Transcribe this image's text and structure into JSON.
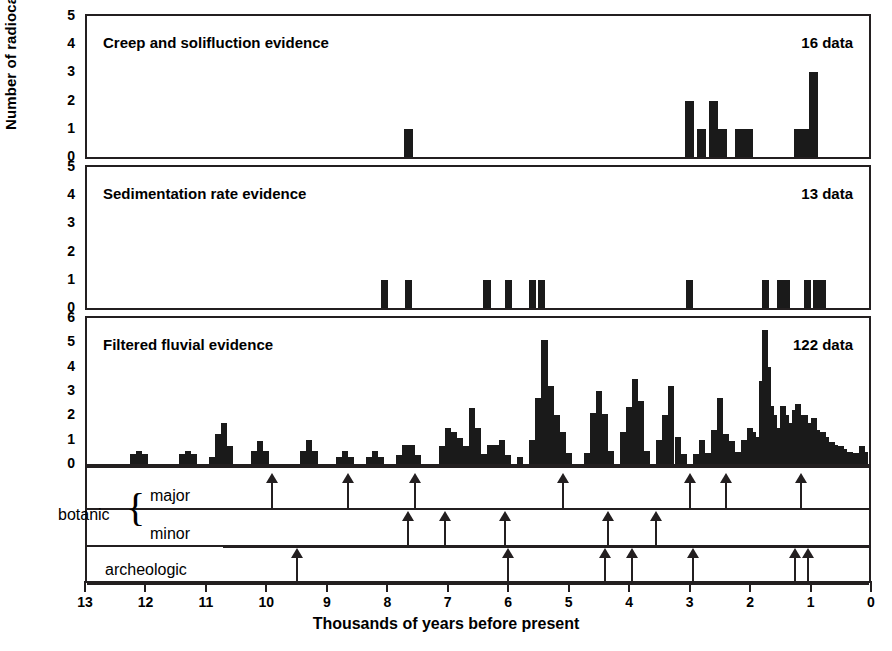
{
  "axis": {
    "ylabel": "Number of radiocarbon dates",
    "xlabel": "Thousands of years before present",
    "xticks": [
      "13",
      "12",
      "11",
      "10",
      "9",
      "8",
      "7",
      "6",
      "5",
      "4",
      "3",
      "2",
      "1",
      "0"
    ],
    "x_min_ka": 0,
    "x_max_ka": 13
  },
  "panels": [
    {
      "title": "Creep and solifluction evidence",
      "count_label": "16 data",
      "yticks": [
        "0",
        "1",
        "2",
        "3",
        "4",
        "5"
      ]
    },
    {
      "title": "Sedimentation rate evidence",
      "count_label": "13 data",
      "yticks": [
        "0",
        "1",
        "2",
        "3",
        "4",
        "5"
      ]
    },
    {
      "title": "Filtered fluvial evidence",
      "count_label": "122 data",
      "yticks": [
        "0",
        "1",
        "2",
        "3",
        "4",
        "5",
        "6"
      ]
    }
  ],
  "event_rows": [
    {
      "name": "botanic-major",
      "label": "major"
    },
    {
      "name": "botanic-minor",
      "label": "minor"
    },
    {
      "name": "archeologic",
      "label": "archeologic"
    }
  ],
  "group_label": "botanic",
  "chart_data": {
    "type": "bar",
    "xlabel": "Thousands of years before present",
    "ylabel": "Number of radiocarbon dates",
    "xlim": [
      13,
      0
    ],
    "x_axis_direction": "reversed",
    "grid": false,
    "legend": "none",
    "bin_width_ka": 0.1,
    "panels": [
      {
        "name": "creep-and-solifluction",
        "title": "Creep and solifluction evidence",
        "n_data": 16,
        "ylim": [
          0,
          5
        ],
        "yticks": [
          0,
          1,
          2,
          3,
          4,
          5
        ],
        "bars": [
          {
            "x_ka": 7.65,
            "value": 1,
            "width_ka": 0.15
          },
          {
            "x_ka": 3.0,
            "value": 2,
            "width_ka": 0.15
          },
          {
            "x_ka": 2.8,
            "value": 1,
            "width_ka": 0.15
          },
          {
            "x_ka": 2.6,
            "value": 2,
            "width_ka": 0.15
          },
          {
            "x_ka": 2.45,
            "value": 1,
            "width_ka": 0.15
          },
          {
            "x_ka": 2.1,
            "value": 1,
            "width_ka": 0.3
          },
          {
            "x_ka": 1.15,
            "value": 1,
            "width_ka": 0.25
          },
          {
            "x_ka": 0.95,
            "value": 3,
            "width_ka": 0.15
          }
        ]
      },
      {
        "name": "sedimentation-rate",
        "title": "Sedimentation rate evidence",
        "n_data": 13,
        "ylim": [
          0,
          5
        ],
        "yticks": [
          0,
          1,
          2,
          3,
          4,
          5
        ],
        "bars": [
          {
            "x_ka": 8.05,
            "value": 1,
            "width_ka": 0.12
          },
          {
            "x_ka": 7.65,
            "value": 1,
            "width_ka": 0.12
          },
          {
            "x_ka": 6.35,
            "value": 1,
            "width_ka": 0.12
          },
          {
            "x_ka": 6.0,
            "value": 1,
            "width_ka": 0.12
          },
          {
            "x_ka": 5.6,
            "value": 1,
            "width_ka": 0.12
          },
          {
            "x_ka": 5.45,
            "value": 1,
            "width_ka": 0.12
          },
          {
            "x_ka": 3.0,
            "value": 1,
            "width_ka": 0.12
          },
          {
            "x_ka": 1.75,
            "value": 1,
            "width_ka": 0.12
          },
          {
            "x_ka": 1.45,
            "value": 1,
            "width_ka": 0.22
          },
          {
            "x_ka": 1.05,
            "value": 1,
            "width_ka": 0.12
          },
          {
            "x_ka": 0.85,
            "value": 1,
            "width_ka": 0.22
          }
        ]
      },
      {
        "name": "filtered-fluvial",
        "title": "Filtered fluvial evidence",
        "n_data": 122,
        "ylim": [
          0,
          6
        ],
        "yticks": [
          0,
          1,
          2,
          3,
          4,
          5,
          6
        ],
        "bars": [
          {
            "x_ka": 12.2,
            "value": 0.4
          },
          {
            "x_ka": 12.1,
            "value": 0.55
          },
          {
            "x_ka": 12.0,
            "value": 0.4
          },
          {
            "x_ka": 11.4,
            "value": 0.4
          },
          {
            "x_ka": 11.3,
            "value": 0.55
          },
          {
            "x_ka": 11.2,
            "value": 0.4
          },
          {
            "x_ka": 10.9,
            "value": 0.3
          },
          {
            "x_ka": 10.8,
            "value": 1.25
          },
          {
            "x_ka": 10.7,
            "value": 1.7
          },
          {
            "x_ka": 10.6,
            "value": 0.75
          },
          {
            "x_ka": 10.2,
            "value": 0.55
          },
          {
            "x_ka": 10.1,
            "value": 0.95
          },
          {
            "x_ka": 10.0,
            "value": 0.55
          },
          {
            "x_ka": 9.4,
            "value": 0.55
          },
          {
            "x_ka": 9.3,
            "value": 1.0
          },
          {
            "x_ka": 9.2,
            "value": 0.55
          },
          {
            "x_ka": 8.8,
            "value": 0.3
          },
          {
            "x_ka": 8.7,
            "value": 0.55
          },
          {
            "x_ka": 8.6,
            "value": 0.3
          },
          {
            "x_ka": 8.3,
            "value": 0.3
          },
          {
            "x_ka": 8.2,
            "value": 0.55
          },
          {
            "x_ka": 8.1,
            "value": 0.3
          },
          {
            "x_ka": 7.8,
            "value": 0.35
          },
          {
            "x_ka": 7.7,
            "value": 0.8
          },
          {
            "x_ka": 7.6,
            "value": 0.8
          },
          {
            "x_ka": 7.5,
            "value": 0.35
          },
          {
            "x_ka": 7.1,
            "value": 0.75
          },
          {
            "x_ka": 7.0,
            "value": 1.5
          },
          {
            "x_ka": 6.9,
            "value": 1.3
          },
          {
            "x_ka": 6.8,
            "value": 1.05
          },
          {
            "x_ka": 6.7,
            "value": 0.75
          },
          {
            "x_ka": 6.6,
            "value": 2.3
          },
          {
            "x_ka": 6.5,
            "value": 1.5
          },
          {
            "x_ka": 6.4,
            "value": 0.4
          },
          {
            "x_ka": 6.3,
            "value": 0.8
          },
          {
            "x_ka": 6.2,
            "value": 0.8
          },
          {
            "x_ka": 6.1,
            "value": 1.0
          },
          {
            "x_ka": 6.0,
            "value": 0.35
          },
          {
            "x_ka": 5.8,
            "value": 0.3
          },
          {
            "x_ka": 5.6,
            "value": 1.0
          },
          {
            "x_ka": 5.5,
            "value": 2.7
          },
          {
            "x_ka": 5.4,
            "value": 5.1
          },
          {
            "x_ka": 5.3,
            "value": 3.2
          },
          {
            "x_ka": 5.2,
            "value": 2.0
          },
          {
            "x_ka": 5.1,
            "value": 1.3
          },
          {
            "x_ka": 5.0,
            "value": 0.45
          },
          {
            "x_ka": 4.7,
            "value": 0.45
          },
          {
            "x_ka": 4.6,
            "value": 2.1
          },
          {
            "x_ka": 4.5,
            "value": 3.0
          },
          {
            "x_ka": 4.4,
            "value": 2.05
          },
          {
            "x_ka": 4.3,
            "value": 0.55
          },
          {
            "x_ka": 4.1,
            "value": 1.3
          },
          {
            "x_ka": 4.0,
            "value": 2.35
          },
          {
            "x_ka": 3.9,
            "value": 3.5
          },
          {
            "x_ka": 3.8,
            "value": 2.6
          },
          {
            "x_ka": 3.7,
            "value": 0.55
          },
          {
            "x_ka": 3.5,
            "value": 1.0
          },
          {
            "x_ka": 3.4,
            "value": 2.0
          },
          {
            "x_ka": 3.3,
            "value": 3.2
          },
          {
            "x_ka": 3.2,
            "value": 1.1
          },
          {
            "x_ka": 3.1,
            "value": 0.4
          },
          {
            "x_ka": 2.9,
            "value": 0.4
          },
          {
            "x_ka": 2.8,
            "value": 1.0
          },
          {
            "x_ka": 2.7,
            "value": 0.45
          },
          {
            "x_ka": 2.6,
            "value": 1.4
          },
          {
            "x_ka": 2.5,
            "value": 2.7
          },
          {
            "x_ka": 2.4,
            "value": 1.25
          },
          {
            "x_ka": 2.3,
            "value": 0.95
          },
          {
            "x_ka": 2.2,
            "value": 0.5
          },
          {
            "x_ka": 2.1,
            "value": 1.0
          },
          {
            "x_ka": 2.0,
            "value": 1.5
          },
          {
            "x_ka": 1.95,
            "value": 1.3
          },
          {
            "x_ka": 1.85,
            "value": 1.1
          },
          {
            "x_ka": 1.8,
            "value": 3.4
          },
          {
            "x_ka": 1.75,
            "value": 5.5
          },
          {
            "x_ka": 1.7,
            "value": 4.0
          },
          {
            "x_ka": 1.65,
            "value": 2.4
          },
          {
            "x_ka": 1.6,
            "value": 2.0
          },
          {
            "x_ka": 1.5,
            "value": 1.5
          },
          {
            "x_ka": 1.45,
            "value": 2.4
          },
          {
            "x_ka": 1.4,
            "value": 2.0
          },
          {
            "x_ka": 1.3,
            "value": 1.7
          },
          {
            "x_ka": 1.25,
            "value": 2.2
          },
          {
            "x_ka": 1.2,
            "value": 2.45
          },
          {
            "x_ka": 1.1,
            "value": 2.0
          },
          {
            "x_ka": 1.05,
            "value": 1.7
          },
          {
            "x_ka": 0.95,
            "value": 1.9
          },
          {
            "x_ka": 0.9,
            "value": 1.4
          },
          {
            "x_ka": 0.8,
            "value": 1.3
          },
          {
            "x_ka": 0.75,
            "value": 1.1
          },
          {
            "x_ka": 0.65,
            "value": 0.9
          },
          {
            "x_ka": 0.6,
            "value": 0.8
          },
          {
            "x_ka": 0.5,
            "value": 0.75
          },
          {
            "x_ka": 0.45,
            "value": 0.6
          },
          {
            "x_ka": 0.35,
            "value": 0.5
          },
          {
            "x_ka": 0.25,
            "value": 0.45
          },
          {
            "x_ka": 0.15,
            "value": 0.75
          },
          {
            "x_ka": 0.1,
            "value": 0.5
          }
        ]
      }
    ],
    "event_markers": [
      {
        "row": "botanic major",
        "x_ka": [
          9.9,
          8.65,
          7.55,
          5.1,
          3.0,
          2.4,
          1.15
        ]
      },
      {
        "row": "botanic minor",
        "x_ka": [
          7.65,
          7.05,
          6.05,
          4.35,
          3.55
        ]
      },
      {
        "row": "archeologic",
        "x_ka": [
          9.5,
          6.0,
          4.4,
          3.95,
          2.95,
          1.25,
          1.05
        ]
      }
    ]
  }
}
